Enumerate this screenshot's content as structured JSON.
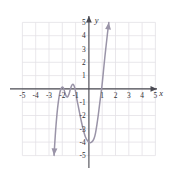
{
  "figure": {
    "kind": "cartesian-coordinate-plane",
    "background_color": "#ffffff",
    "grid_color": "#e3e1e6",
    "axis_color": "#4a4a52",
    "curve_color": "#9a94a8",
    "label_color": "#2e2e34",
    "axis_names": {
      "x": "x",
      "y": "y"
    }
  },
  "chart_data": {
    "type": "line",
    "title": "",
    "xlabel": "x",
    "ylabel": "y",
    "grid": true,
    "legend": null,
    "xlim": [
      -5.5,
      5.5
    ],
    "ylim": [
      -5.5,
      5.5
    ],
    "xticks": [
      -5,
      -4,
      -3,
      -2,
      -1,
      1,
      2,
      3,
      4,
      5
    ],
    "yticks": [
      5,
      4,
      3,
      2,
      1,
      -1,
      -2,
      -3,
      -4,
      -5
    ],
    "xtick_labels": [
      "-5",
      "-4",
      "-3",
      "-2",
      "-1",
      "1",
      "2",
      "3",
      "4",
      "5"
    ],
    "ytick_labels": [
      "5",
      "4",
      "3",
      "2",
      "1",
      "-1",
      "-2",
      "-3",
      "-4",
      "-5"
    ],
    "series": [
      {
        "name": "polynomial",
        "arrow_start": "down-left",
        "arrow_end": "up-right",
        "x": [
          -2.62,
          -2.58,
          -2.5,
          -2.4,
          -2.3,
          -2.2,
          -2.1,
          -2.0,
          -1.9,
          -1.8,
          -1.7,
          -1.6,
          -1.5,
          -1.4,
          -1.3,
          -1.2,
          -1.1,
          -1.0,
          -0.9,
          -0.8,
          -0.7,
          -0.6,
          -0.5,
          -0.4,
          -0.3,
          -0.2,
          -0.1,
          0.0,
          0.1,
          0.2,
          0.3,
          0.4,
          0.5,
          0.6,
          0.7,
          0.8,
          0.9,
          1.0,
          1.1,
          1.2,
          1.3,
          1.4,
          1.5
        ],
        "y": [
          -5.0,
          -4.3,
          -3.1,
          -1.9,
          -1.0,
          -0.35,
          0.0,
          0.15,
          0.05,
          -0.3,
          -0.55,
          -0.6,
          -0.4,
          -0.05,
          0.25,
          0.35,
          0.2,
          -0.2,
          -0.8,
          -1.3,
          -1.8,
          -2.3,
          -2.75,
          -3.15,
          -3.5,
          -3.75,
          -3.9,
          -4.0,
          -4.05,
          -4.0,
          -3.9,
          -3.7,
          -3.3,
          -2.7,
          -2.0,
          -1.2,
          -0.4,
          0.4,
          1.4,
          2.4,
          3.3,
          4.2,
          5.0
        ]
      }
    ]
  }
}
